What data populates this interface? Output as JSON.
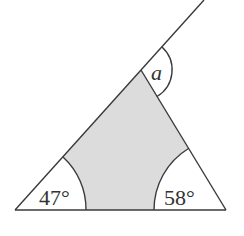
{
  "diagram": {
    "title": "",
    "type": "triangle-exterior-angle",
    "colors": {
      "stroke": "#3a3a3a",
      "shaded_region": "#dcdcdc",
      "background": "#ffffff",
      "text": "#333333"
    },
    "vertices": {
      "left": {
        "x": 15,
        "y": 210
      },
      "right": {
        "x": 226,
        "y": 210
      },
      "top": {
        "x": 141,
        "y": 70
      }
    },
    "extension_end": {
      "x": 204,
      "y": 0
    },
    "angles": {
      "left": {
        "label": "47°",
        "value": 47
      },
      "right": {
        "label": "58°",
        "value": 58
      },
      "exterior": {
        "label": "a",
        "value": null
      }
    }
  }
}
